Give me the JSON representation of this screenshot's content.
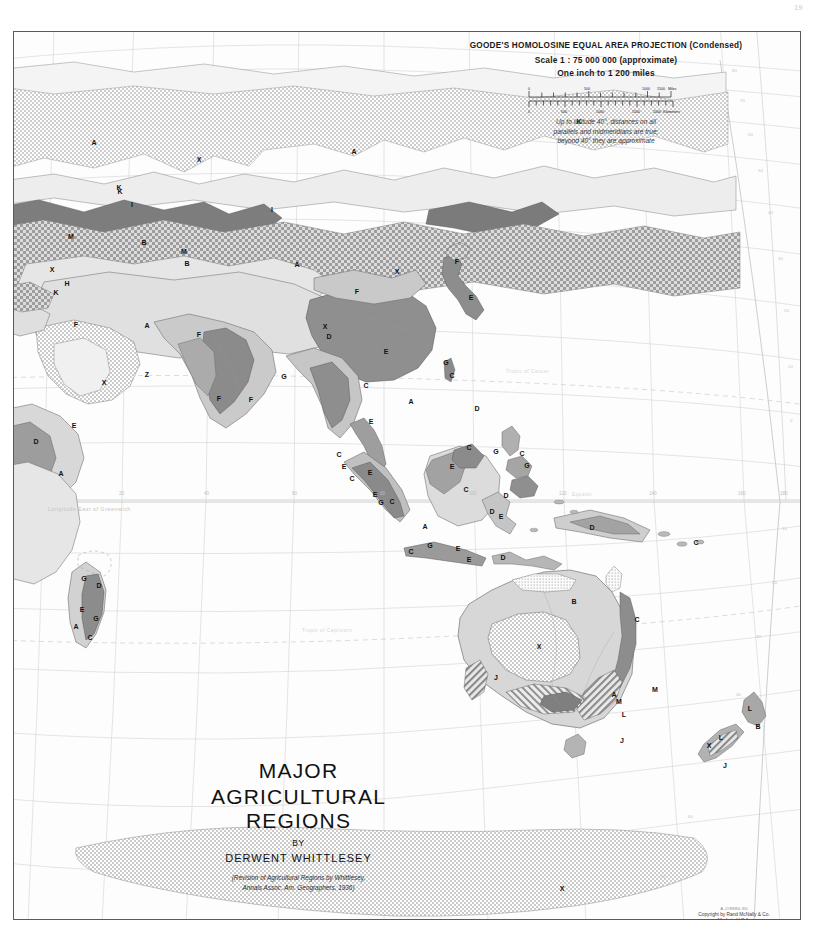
{
  "page_number": "19",
  "legend": {
    "projection_line": "GOODE'S HOMOLOSINE EQUAL AREA PROJECTION  (Condensed)",
    "scale_line": "Scale 1 : 75 000 000 (approximate)",
    "inch_line": "One inch to 1 200 miles",
    "miles_ticks": [
      "0",
      "500",
      "1000",
      "1500"
    ],
    "miles_unit": "Miles",
    "km_ticks": [
      "0",
      "500",
      "1000",
      "1500",
      "2000"
    ],
    "km_unit": "Kilometers",
    "note_line1": "Up to latitude 40°, distances on all",
    "note_line2": "parallels and midmeridians are true;",
    "note_line3": "beyond 40° they are approximate"
  },
  "title_block": {
    "line1": "MAJOR",
    "line2": "AGRICULTURAL REGIONS",
    "by": "BY",
    "author": "DERWENT WHITTLESEY",
    "credit_line1": "(Revision of Agricultural Regions by Whittlesey,",
    "credit_line2": "Annals Assoc. Am. Geographers, 1936)"
  },
  "imprint": {
    "plate_code": "A-2/8880-80",
    "copyright": "Copyright by Rand McNally & Co.",
    "made_in": "Made in U.S.A."
  },
  "map": {
    "graticule_text": {
      "longitude_caption": "Longitude East of Greenwich",
      "tropic_cancer": "Tropic of Cancer",
      "tropic_capricorn": "Tropic of Capricorn",
      "equator": "Equator"
    },
    "meridian_labels": [
      "20",
      "40",
      "60",
      "80",
      "100",
      "120",
      "140",
      "160",
      "180"
    ],
    "parallel_labels": [
      "80",
      "70",
      "60",
      "50",
      "40",
      "30",
      "20",
      "10",
      "0",
      "10",
      "20",
      "30",
      "40",
      "50",
      "60",
      "70"
    ],
    "region_letters": [
      {
        "label": "A",
        "x": 80,
        "y": 113
      },
      {
        "label": "A",
        "x": 340,
        "y": 122
      },
      {
        "label": "X",
        "x": 185,
        "y": 130
      },
      {
        "label": "K",
        "x": 105,
        "y": 158
      },
      {
        "label": "K",
        "x": 565,
        "y": 92
      },
      {
        "label": "I",
        "x": 118,
        "y": 175
      },
      {
        "label": "I",
        "x": 258,
        "y": 180
      },
      {
        "label": "K",
        "x": 106,
        "y": 162
      },
      {
        "label": "M",
        "x": 57,
        "y": 207
      },
      {
        "label": "B",
        "x": 130,
        "y": 213
      },
      {
        "label": "M",
        "x": 170,
        "y": 222
      },
      {
        "label": "B",
        "x": 173,
        "y": 234
      },
      {
        "label": "X",
        "x": 38,
        "y": 240
      },
      {
        "label": "H",
        "x": 53,
        "y": 254
      },
      {
        "label": "K",
        "x": 42,
        "y": 263
      },
      {
        "label": "A",
        "x": 283,
        "y": 235
      },
      {
        "label": "X",
        "x": 383,
        "y": 242
      },
      {
        "label": "F",
        "x": 443,
        "y": 232
      },
      {
        "label": "E",
        "x": 457,
        "y": 268
      },
      {
        "label": "F",
        "x": 343,
        "y": 262
      },
      {
        "label": "X",
        "x": 311,
        "y": 297
      },
      {
        "label": "F",
        "x": 62,
        "y": 295
      },
      {
        "label": "A",
        "x": 133,
        "y": 296
      },
      {
        "label": "F",
        "x": 185,
        "y": 305
      },
      {
        "label": "D",
        "x": 315,
        "y": 307
      },
      {
        "label": "E",
        "x": 372,
        "y": 322
      },
      {
        "label": "G",
        "x": 432,
        "y": 333
      },
      {
        "label": "C",
        "x": 438,
        "y": 346
      },
      {
        "label": "X",
        "x": 90,
        "y": 353
      },
      {
        "label": "Z",
        "x": 133,
        "y": 345
      },
      {
        "label": "G",
        "x": 270,
        "y": 347
      },
      {
        "label": "F",
        "x": 205,
        "y": 369
      },
      {
        "label": "F",
        "x": 237,
        "y": 370
      },
      {
        "label": "C",
        "x": 352,
        "y": 356
      },
      {
        "label": "A",
        "x": 397,
        "y": 372
      },
      {
        "label": "D",
        "x": 463,
        "y": 379
      },
      {
        "label": "E",
        "x": 60,
        "y": 396
      },
      {
        "label": "D",
        "x": 22,
        "y": 412
      },
      {
        "label": "E",
        "x": 357,
        "y": 392
      },
      {
        "label": "C",
        "x": 455,
        "y": 418
      },
      {
        "label": "G",
        "x": 482,
        "y": 422
      },
      {
        "label": "C",
        "x": 325,
        "y": 425
      },
      {
        "label": "C",
        "x": 508,
        "y": 424
      },
      {
        "label": "A",
        "x": 47,
        "y": 444
      },
      {
        "label": "E",
        "x": 330,
        "y": 437
      },
      {
        "label": "E",
        "x": 356,
        "y": 443
      },
      {
        "label": "G",
        "x": 513,
        "y": 436
      },
      {
        "label": "E",
        "x": 438,
        "y": 437
      },
      {
        "label": "C",
        "x": 338,
        "y": 449
      },
      {
        "label": "C",
        "x": 452,
        "y": 460
      },
      {
        "label": "E",
        "x": 361,
        "y": 465
      },
      {
        "label": "G",
        "x": 367,
        "y": 473
      },
      {
        "label": "C",
        "x": 378,
        "y": 472
      },
      {
        "label": "D",
        "x": 492,
        "y": 466
      },
      {
        "label": "D",
        "x": 478,
        "y": 482
      },
      {
        "label": "E",
        "x": 487,
        "y": 487
      },
      {
        "label": "A",
        "x": 411,
        "y": 497
      },
      {
        "label": "D",
        "x": 578,
        "y": 498
      },
      {
        "label": "C",
        "x": 682,
        "y": 513
      },
      {
        "label": "G",
        "x": 416,
        "y": 516
      },
      {
        "label": "E",
        "x": 444,
        "y": 519
      },
      {
        "label": "C",
        "x": 397,
        "y": 522
      },
      {
        "label": "E",
        "x": 455,
        "y": 530
      },
      {
        "label": "D",
        "x": 489,
        "y": 528
      },
      {
        "label": "G",
        "x": 70,
        "y": 549
      },
      {
        "label": "D",
        "x": 85,
        "y": 556
      },
      {
        "label": "E",
        "x": 68,
        "y": 580
      },
      {
        "label": "G",
        "x": 82,
        "y": 589
      },
      {
        "label": "A",
        "x": 62,
        "y": 597
      },
      {
        "label": "C",
        "x": 76,
        "y": 608
      },
      {
        "label": "B",
        "x": 560,
        "y": 572
      },
      {
        "label": "C",
        "x": 623,
        "y": 590
      },
      {
        "label": "X",
        "x": 525,
        "y": 617
      },
      {
        "label": "J",
        "x": 482,
        "y": 648
      },
      {
        "label": "M",
        "x": 641,
        "y": 660
      },
      {
        "label": "A",
        "x": 600,
        "y": 665
      },
      {
        "label": "M",
        "x": 605,
        "y": 672
      },
      {
        "label": "L",
        "x": 610,
        "y": 685
      },
      {
        "label": "J",
        "x": 608,
        "y": 711
      },
      {
        "label": "L",
        "x": 736,
        "y": 679
      },
      {
        "label": "B",
        "x": 744,
        "y": 697
      },
      {
        "label": "L",
        "x": 707,
        "y": 708
      },
      {
        "label": "X",
        "x": 695,
        "y": 716
      },
      {
        "label": "J",
        "x": 711,
        "y": 736
      },
      {
        "label": "X",
        "x": 548,
        "y": 859
      }
    ]
  },
  "colors": {
    "frame_stroke": "#5a5a5a",
    "graticule": "#cfcfcf",
    "coast": "#555555",
    "fill_light": "#efefef",
    "fill_pale": "#e2e2e2",
    "fill_mid": "#c8c8c8",
    "fill_grey": "#a8a8a8",
    "fill_dark": "#8b8b8b",
    "fill_darker": "#6e6e6e",
    "label_text": "#111111",
    "legend_text": "#1a1a1a"
  }
}
